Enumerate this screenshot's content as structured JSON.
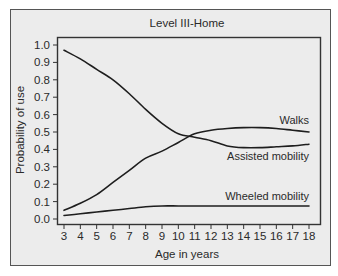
{
  "chart_data": {
    "type": "line",
    "title": "Level III-Home",
    "xlabel": "Age in years",
    "ylabel": "Probability of use",
    "xlim": [
      3,
      18
    ],
    "ylim": [
      0.0,
      1.0
    ],
    "grid": false,
    "legend": "inline labels at right end of each line",
    "x": [
      3,
      4,
      5,
      6,
      7,
      8,
      9,
      10,
      11,
      12,
      13,
      14,
      15,
      16,
      17,
      18
    ],
    "x_tick_labels": [
      "3",
      "4",
      "5",
      "6",
      "7",
      "8",
      "9",
      "10",
      "11",
      "12",
      "13",
      "14",
      "15",
      "16",
      "17",
      "18"
    ],
    "y_tick_labels": [
      "0.0",
      "0.1",
      "0.2",
      "0.3",
      "0.4",
      "0.5",
      "0.6",
      "0.7",
      "0.8",
      "0.9",
      "1.0"
    ],
    "series": [
      {
        "name": "Walks",
        "values": [
          0.05,
          0.09,
          0.14,
          0.21,
          0.28,
          0.35,
          0.39,
          0.44,
          0.49,
          0.51,
          0.52,
          0.525,
          0.525,
          0.52,
          0.51,
          0.5
        ]
      },
      {
        "name": "Assisted mobility",
        "values": [
          0.97,
          0.92,
          0.86,
          0.8,
          0.72,
          0.63,
          0.55,
          0.49,
          0.47,
          0.45,
          0.42,
          0.41,
          0.41,
          0.415,
          0.42,
          0.43
        ]
      },
      {
        "name": "Wheeled mobility",
        "values": [
          0.02,
          0.03,
          0.04,
          0.05,
          0.06,
          0.07,
          0.075,
          0.075,
          0.075,
          0.075,
          0.075,
          0.075,
          0.075,
          0.075,
          0.075,
          0.075
        ]
      }
    ],
    "annotations": [
      {
        "text": "Walks",
        "series": "Walks"
      },
      {
        "text": "Assisted mobility",
        "series": "Assisted mobility"
      },
      {
        "text": "Wheeled mobility",
        "series": "Wheeled mobility"
      }
    ]
  },
  "colors": {
    "background": "#ececec",
    "frame": "#555555",
    "line": "#1e1e1e",
    "text": "#2a2a2a"
  }
}
